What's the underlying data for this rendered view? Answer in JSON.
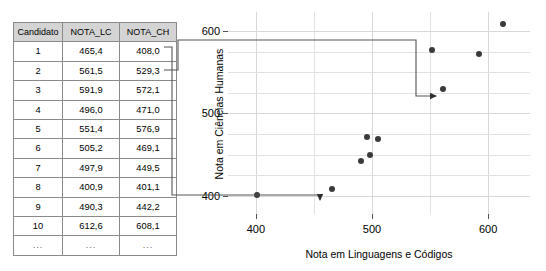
{
  "table": {
    "columns": [
      "Candidato",
      "NOTA_LC",
      "NOTA_CH"
    ],
    "rows": [
      {
        "candidato": "1",
        "nota_lc": "465,4",
        "nota_ch": "408,0"
      },
      {
        "candidato": "2",
        "nota_lc": "561,5",
        "nota_ch": "529,3"
      },
      {
        "candidato": "3",
        "nota_lc": "591,9",
        "nota_ch": "572,1"
      },
      {
        "candidato": "4",
        "nota_lc": "496,0",
        "nota_ch": "471,0"
      },
      {
        "candidato": "5",
        "nota_lc": "551,4",
        "nota_ch": "576,9"
      },
      {
        "candidato": "6",
        "nota_lc": "505,2",
        "nota_ch": "469,1"
      },
      {
        "candidato": "7",
        "nota_lc": "497,9",
        "nota_ch": "449,5"
      },
      {
        "candidato": "8",
        "nota_lc": "400,9",
        "nota_ch": "401,1"
      },
      {
        "candidato": "9",
        "nota_lc": "490,3",
        "nota_ch": "442,2"
      },
      {
        "candidato": "10",
        "nota_lc": "612,6",
        "nota_ch": "608,1"
      },
      {
        "candidato": "...",
        "nota_lc": "...",
        "nota_ch": "..."
      }
    ]
  },
  "chart_data": {
    "type": "scatter",
    "title": "",
    "xlabel": "Nota em Linguagens e Códigos",
    "ylabel": "Nota em Ciências Humanas",
    "xlim": [
      376,
      636
    ],
    "ylim": [
      378,
      623
    ],
    "xticks": [
      400,
      500,
      600
    ],
    "yticks": [
      400,
      500,
      600
    ],
    "xticklabels": [
      "400",
      "500",
      "600"
    ],
    "yticklabels": [
      "400",
      "500",
      "600"
    ],
    "grid": true,
    "legend": null,
    "point_color": "#3a3a3a",
    "grid_color": "#e2e2e2",
    "x": [
      465.4,
      561.5,
      591.9,
      496.0,
      551.4,
      505.2,
      497.9,
      400.9,
      490.3,
      612.6
    ],
    "y": [
      408.0,
      529.3,
      572.1,
      471.0,
      576.9,
      469.1,
      449.5,
      401.1,
      442.2,
      608.1
    ],
    "labels": [
      "1",
      "2",
      "3",
      "4",
      "5",
      "6",
      "7",
      "8",
      "9",
      "10"
    ]
  },
  "annotations": {
    "callout_row1": {
      "source_row": "1",
      "target_value": "408,0",
      "arrow": "down"
    },
    "callout_row2": {
      "source_row": "2",
      "target_value": "529,3",
      "arrow": "right"
    },
    "line_color": "#555555"
  }
}
